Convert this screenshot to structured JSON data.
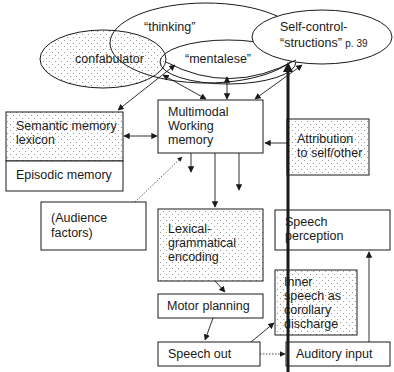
{
  "ellipses": {
    "thinking": {
      "label": "“thinking”"
    },
    "confabulator": {
      "label": "confabulator"
    },
    "mentalese": {
      "label": "“mentalese”"
    },
    "self_control": {
      "line1": "Self-control-",
      "line2_main": "“structions”",
      "line2_ref": "p. 39"
    }
  },
  "boxes": {
    "semantic_memory": {
      "line1": "Semantic memory",
      "line2": "lexicon"
    },
    "episodic_memory": {
      "label": "Episodic memory"
    },
    "working_memory": {
      "line1": "Multimodal",
      "line2": "Working",
      "line3": "memory"
    },
    "attribution": {
      "line1": "Attribution",
      "line2": "to self/other"
    },
    "audience": {
      "line1": "(Audience",
      "line2": "factors)"
    },
    "lexical": {
      "line1": "Lexical-",
      "line2": "grammatical",
      "line3": "encoding"
    },
    "speech_perception": {
      "line1": "Speech",
      "line2": "perception"
    },
    "motor_planning": {
      "label": "Motor planning"
    },
    "inner_speech": {
      "line1": "Inner",
      "line2": "speech as",
      "line3": "corollary",
      "line4": "discharge"
    },
    "speech_out": {
      "label": "Speech out"
    },
    "auditory_input": {
      "label": "Auditory input"
    }
  },
  "style": {
    "stroke": "#1a1a1a",
    "dot_fill": "#9a9a9a",
    "background": "#ffffff"
  }
}
